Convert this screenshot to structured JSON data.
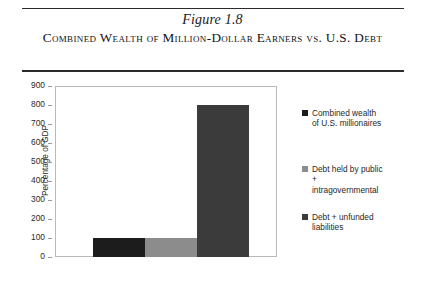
{
  "header": {
    "figure_number": "Figure 1.8",
    "title": "Combined Wealth of Million-Dollar Earners vs. U.S. Debt"
  },
  "chart_data": {
    "type": "bar",
    "title": "Combined Wealth of Million-Dollar Earners vs. U.S. Debt",
    "xlabel": "",
    "ylabel": "Percentage of GDP",
    "ylim": [
      0,
      900
    ],
    "ytick_interval": 100,
    "yticks": [
      0,
      100,
      200,
      300,
      400,
      500,
      600,
      700,
      800,
      900
    ],
    "ytick_labels": [
      "0",
      "100",
      "200",
      "300",
      "400",
      "500",
      "600",
      "700",
      "800",
      "900"
    ],
    "grid": false,
    "legend_position": "right",
    "categories": [
      "Combined wealth of U.S. millionaires",
      "Debt held by public + intragovernmental",
      "Debt + unfunded liabilities"
    ],
    "values": [
      100,
      100,
      800
    ],
    "colors": [
      "#1c1c1c",
      "#8c8c8c",
      "#3b3b3b"
    ]
  },
  "legend": {
    "items": [
      {
        "label": "Combined wealth\nof U.S. millionaires",
        "color": "#1c1c1c"
      },
      {
        "label": "Debt held by public\n+\nintragovernmental",
        "color": "#8c8c8c"
      },
      {
        "label": "Debt + unfunded\nliabilities",
        "color": "#3b3b3b"
      }
    ]
  }
}
